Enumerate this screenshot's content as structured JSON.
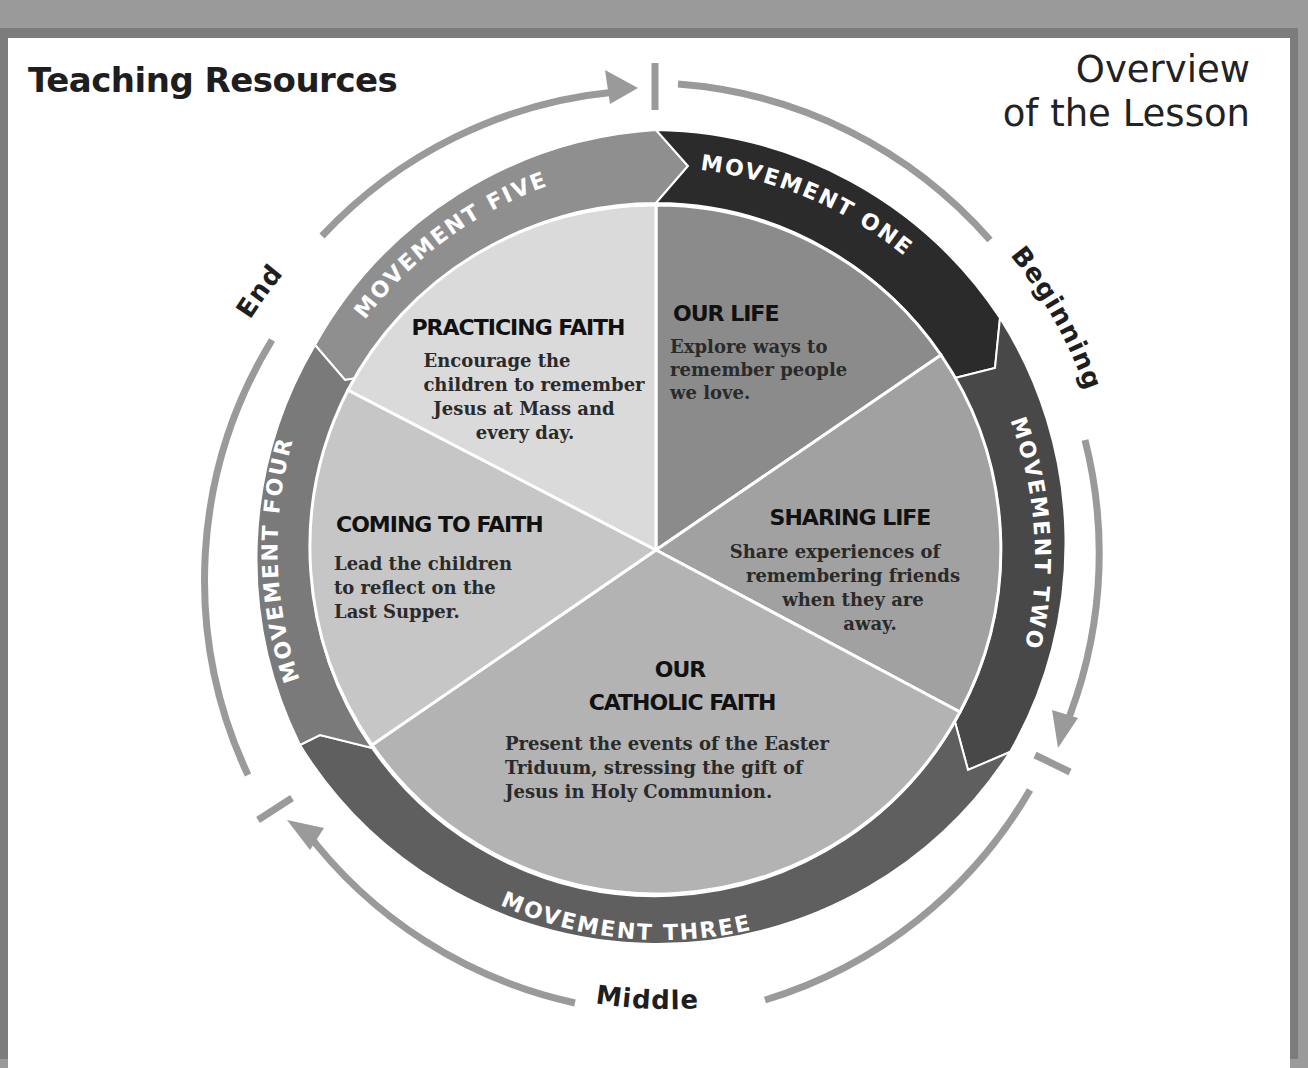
{
  "header": {
    "title": "Teaching Resources",
    "subtitle_line1": "Overview",
    "subtitle_line2": "of the Lesson"
  },
  "phases": {
    "beginning": "Beginning",
    "middle": "Middle",
    "end": "End"
  },
  "movements": [
    {
      "label": "MOVEMENT ONE",
      "color": "#2b2b2b"
    },
    {
      "label": "MOVEMENT TWO",
      "color": "#484848"
    },
    {
      "label": "MOVEMENT THREE",
      "color": "#5f5f5f"
    },
    {
      "label": "MOVEMENT FOUR",
      "color": "#7a7a7a"
    },
    {
      "label": "MOVEMENT FIVE",
      "color": "#8f8f8f"
    }
  ],
  "segments": [
    {
      "title": "OUR LIFE",
      "lines": [
        "Explore ways to",
        "remember people",
        "we love."
      ],
      "color": "#8b8b8b"
    },
    {
      "title": "SHARING LIFE",
      "lines": [
        "Share experiences of",
        "remembering friends",
        "when they are",
        "away."
      ],
      "color": "#a1a1a1"
    },
    {
      "title_line1": "OUR",
      "title_line2": "CATHOLIC FAITH",
      "lines": [
        "Present the events of the Easter",
        "Triduum, stressing the gift of",
        "Jesus in Holy Communion."
      ],
      "color": "#b3b3b3"
    },
    {
      "title": "COMING TO FAITH",
      "lines": [
        "Lead the children",
        "to reflect on the",
        "Last Supper."
      ],
      "color": "#c6c6c6"
    },
    {
      "title": "PRACTICING FAITH",
      "lines": [
        "Encourage the",
        "children to remember",
        "Jesus at Mass and",
        "every day."
      ],
      "color": "#dadada"
    }
  ],
  "colors": {
    "guide_arc": "#9a9a9a",
    "divider": "#ffffff",
    "frame": "#7c7c7c"
  }
}
